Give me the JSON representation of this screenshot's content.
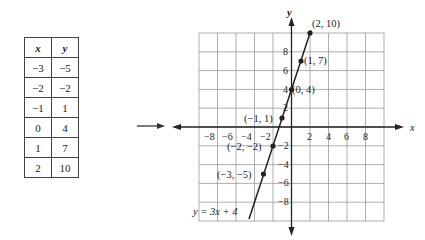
{
  "table": {
    "headers": [
      "x",
      "y"
    ],
    "rows": [
      [
        "−3",
        "−5"
      ],
      [
        "−2",
        "−2"
      ],
      [
        "−1",
        "1"
      ],
      [
        "0",
        "4"
      ],
      [
        "1",
        "7"
      ],
      [
        "2",
        "10"
      ]
    ]
  },
  "arrow": "right-arrow",
  "graph": {
    "x_axis_label": "x",
    "y_axis_label": "y",
    "x_ticks": [
      "−8",
      "−6",
      "−4",
      "−2",
      "2",
      "4",
      "6",
      "8"
    ],
    "y_ticks": [
      "8",
      "6",
      "4",
      "2",
      "−2",
      "−4",
      "−6",
      "−8"
    ],
    "equation": "y = 3x + 4",
    "points": [
      {
        "label": "(2, 10)"
      },
      {
        "label": "(1, 7)"
      },
      {
        "label": "(0, 4)"
      },
      {
        "label": "(−1, 1)"
      },
      {
        "label": "(−2, −2)"
      },
      {
        "label": "(−3, −5)"
      }
    ]
  },
  "chart_data": {
    "type": "line",
    "title": "",
    "xlabel": "x",
    "ylabel": "y",
    "xlim": [
      -10,
      10
    ],
    "ylim": [
      -10,
      10
    ],
    "grid": true,
    "x": [
      -3,
      -2,
      -1,
      0,
      1,
      2
    ],
    "series": [
      {
        "name": "y = 3x + 4",
        "values": [
          -5,
          -2,
          1,
          4,
          7,
          10
        ]
      }
    ],
    "annotations": [
      "(2, 10)",
      "(1, 7)",
      "(0, 4)",
      "(−1, 1)",
      "(−2, −2)",
      "(−3, −5)",
      "y = 3x + 4"
    ],
    "table": {
      "headers": [
        "x",
        "y"
      ],
      "rows": [
        [
          -3,
          -5
        ],
        [
          -2,
          -2
        ],
        [
          -1,
          1
        ],
        [
          0,
          4
        ],
        [
          1,
          7
        ],
        [
          2,
          10
        ]
      ]
    }
  }
}
